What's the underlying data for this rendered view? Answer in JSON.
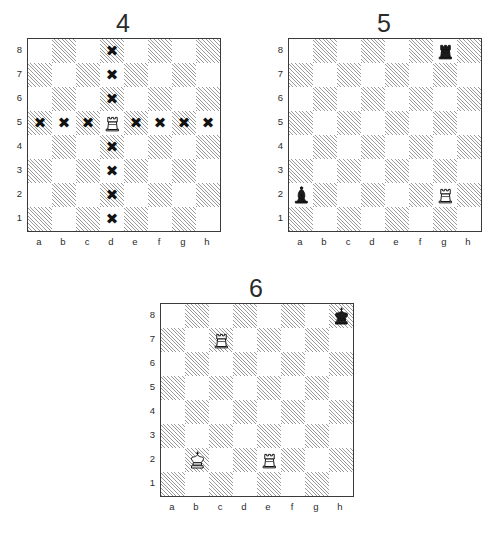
{
  "page": {
    "background": "#ffffff",
    "dark_square_color": "#9a9a9a",
    "light_square_color": "#ffffff",
    "border_color": "#3a3a3a",
    "marker_color": "#121212"
  },
  "files": [
    "a",
    "b",
    "c",
    "d",
    "e",
    "f",
    "g",
    "h"
  ],
  "ranks": [
    "8",
    "7",
    "6",
    "5",
    "4",
    "3",
    "2",
    "1"
  ],
  "diagrams": [
    {
      "id": "diagram-4",
      "number": "4",
      "position": {
        "left": 14,
        "top": 8
      },
      "pieces": [
        {
          "square": "d5",
          "piece": "rook",
          "color": "white",
          "glyph": "white-rook"
        }
      ],
      "markers": [
        {
          "square": "d8",
          "type": "x"
        },
        {
          "square": "d7",
          "type": "x"
        },
        {
          "square": "d6",
          "type": "x"
        },
        {
          "square": "a5",
          "type": "x"
        },
        {
          "square": "b5",
          "type": "x"
        },
        {
          "square": "c5",
          "type": "x"
        },
        {
          "square": "e5",
          "type": "x"
        },
        {
          "square": "f5",
          "type": "x"
        },
        {
          "square": "g5",
          "type": "x"
        },
        {
          "square": "h5",
          "type": "x"
        },
        {
          "square": "d4",
          "type": "x"
        },
        {
          "square": "d3",
          "type": "x"
        },
        {
          "square": "d2",
          "type": "x"
        },
        {
          "square": "d1",
          "type": "x"
        }
      ],
      "marker_symbol": "✖"
    },
    {
      "id": "diagram-5",
      "number": "5",
      "position": {
        "left": 275,
        "top": 8
      },
      "pieces": [
        {
          "square": "g8",
          "piece": "rook",
          "color": "black",
          "glyph": "black-rook"
        },
        {
          "square": "a2",
          "piece": "bishop",
          "color": "black",
          "glyph": "black-bishop"
        },
        {
          "square": "g2",
          "piece": "rook",
          "color": "white",
          "glyph": "white-rook"
        }
      ],
      "markers": [],
      "marker_symbol": "✖"
    },
    {
      "id": "diagram-6",
      "number": "6",
      "position": {
        "left": 147,
        "top": 273
      },
      "pieces": [
        {
          "square": "h8",
          "piece": "king",
          "color": "black",
          "glyph": "black-king"
        },
        {
          "square": "c7",
          "piece": "rook",
          "color": "white",
          "glyph": "white-rook"
        },
        {
          "square": "b2",
          "piece": "king",
          "color": "white",
          "glyph": "white-king"
        },
        {
          "square": "e2",
          "piece": "rook",
          "color": "white",
          "glyph": "white-rook"
        }
      ],
      "markers": [],
      "marker_symbol": "✖"
    }
  ]
}
